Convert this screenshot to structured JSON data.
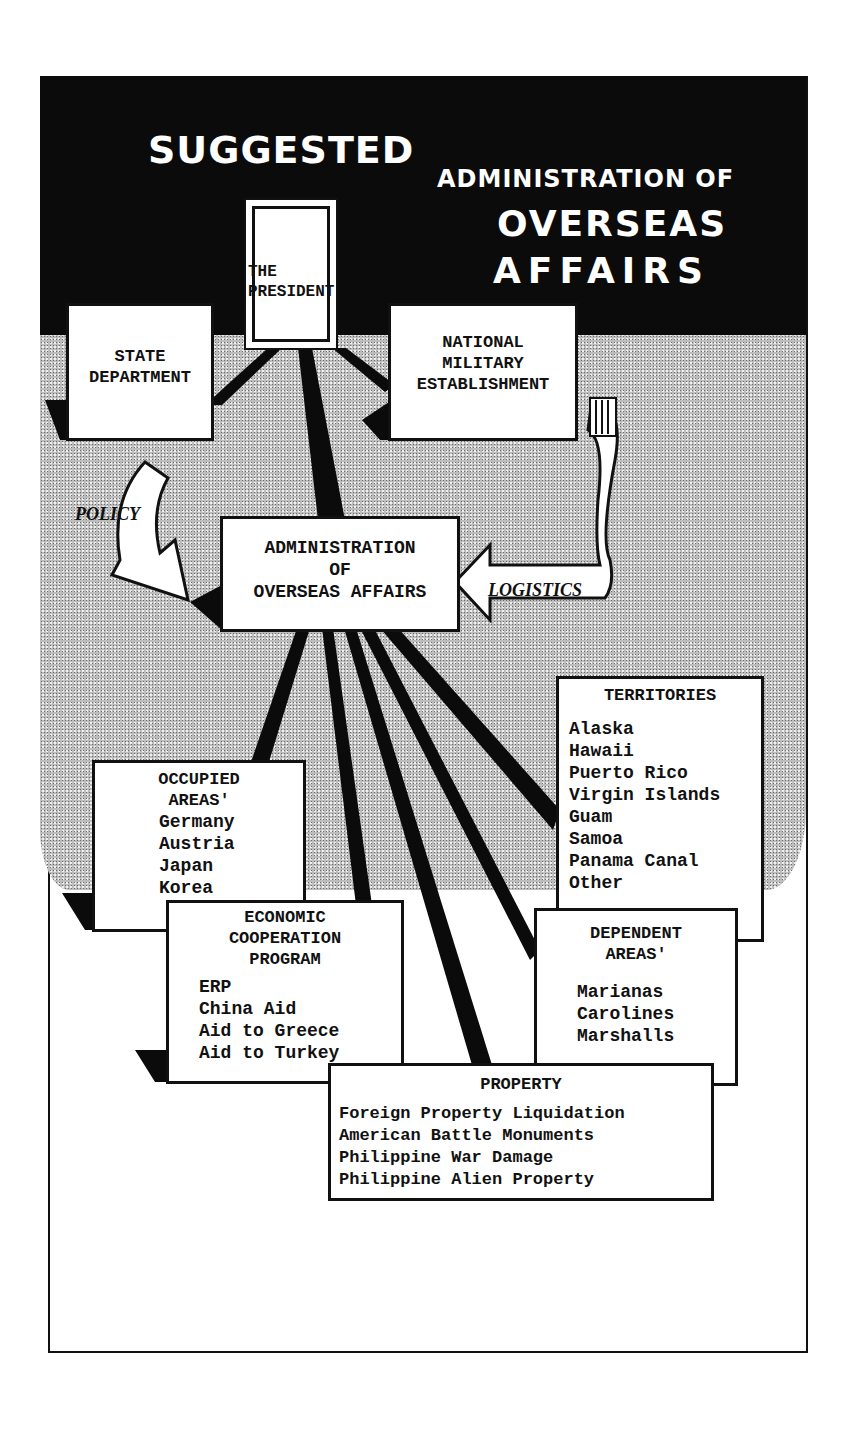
{
  "title": {
    "line1": "SUGGESTED",
    "line2": "ADMINISTRATION OF",
    "line3": "OVERSEAS",
    "line4": "AFFAIRS"
  },
  "nodes": {
    "president": {
      "label_line1": "THE",
      "label_line2": "PRESIDENT"
    },
    "state_department": {
      "label_line1": "STATE",
      "label_line2": "DEPARTMENT"
    },
    "military": {
      "label_line1": "NATIONAL",
      "label_line2": "MILITARY",
      "label_line3": "ESTABLISHMENT"
    },
    "admin": {
      "label_line1": "ADMINISTRATION",
      "label_line2": "OF",
      "label_line3": "OVERSEAS AFFAIRS"
    },
    "territories": {
      "header": "TERRITORIES",
      "items": [
        "Alaska",
        "Hawaii",
        "Puerto Rico",
        "Virgin Islands",
        "Guam",
        "Samoa",
        "Panama Canal",
        "Other"
      ]
    },
    "occupied": {
      "header_line1": "OCCUPIED",
      "header_line2": "AREAS'",
      "items": [
        "Germany",
        "Austria",
        "Japan",
        "Korea"
      ]
    },
    "economic": {
      "header_line1": "ECONOMIC",
      "header_line2": "COOPERATION",
      "header_line3": "PROGRAM",
      "items": [
        "ERP",
        "China Aid",
        "Aid to Greece",
        "Aid to Turkey"
      ]
    },
    "dependent": {
      "header_line1": "DEPENDENT",
      "header_line2": "AREAS'",
      "items": [
        "Marianas",
        "Carolines",
        "Marshalls"
      ]
    },
    "property": {
      "header": "PROPERTY",
      "items": [
        "Foreign Property Liquidation",
        "American Battle Monuments",
        "Philippine War Damage",
        "Philippine Alien Property"
      ]
    }
  },
  "arrows": {
    "policy": "POLICY",
    "logistics": "LOGISTICS"
  }
}
